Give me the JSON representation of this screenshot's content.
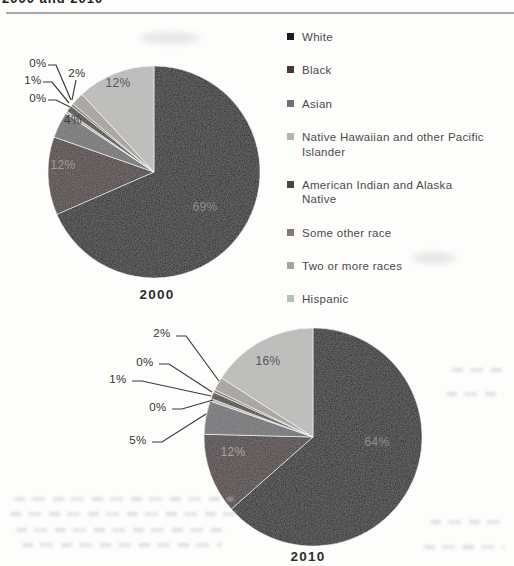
{
  "page": {
    "heading_fragment": "2000 and 2010"
  },
  "legend": {
    "items": [
      {
        "label": "White",
        "color": "#1d1c1e"
      },
      {
        "label": "Black",
        "color": "#473837"
      },
      {
        "label": "Asian",
        "color": "#707073"
      },
      {
        "label": "Native Hawaiian and other Pacific Islander",
        "color": "#b3b3b1"
      },
      {
        "label": "American Indian and Alaska Native",
        "color": "#46453e"
      },
      {
        "label": "Some other race",
        "color": "#837a74"
      },
      {
        "label": "Two or more races",
        "color": "#a8a29e"
      },
      {
        "label": "Hispanic",
        "color": "#bdbdbb"
      }
    ]
  },
  "chart_data": [
    {
      "type": "pie",
      "title": "2000",
      "categories": [
        "White",
        "Black",
        "Asian",
        "Native Hawaiian and other Pacific Islander",
        "American Indian and Alaska Native",
        "Some other race",
        "Two or more races",
        "Hispanic"
      ],
      "values": [
        69,
        12,
        4,
        0,
        1,
        0,
        2,
        12
      ],
      "labels": [
        "69%",
        "12%",
        "4%",
        "0%",
        "1%",
        "0%",
        "2%",
        "12%"
      ],
      "legend_position": "right",
      "start_angle_deg": 0,
      "direction": "clockwise"
    },
    {
      "type": "pie",
      "title": "2010",
      "categories": [
        "White",
        "Black",
        "Asian",
        "Native Hawaiian and other Pacific Islander",
        "American Indian and Alaska Native",
        "Some other race",
        "Two or more races",
        "Hispanic"
      ],
      "values": [
        64,
        12,
        5,
        0,
        1,
        0,
        2,
        16
      ],
      "labels": [
        "64%",
        "12%",
        "5%",
        "0%",
        "1%",
        "0%",
        "2%",
        "16%"
      ],
      "legend_position": "right",
      "start_angle_deg": 0,
      "direction": "clockwise"
    }
  ]
}
